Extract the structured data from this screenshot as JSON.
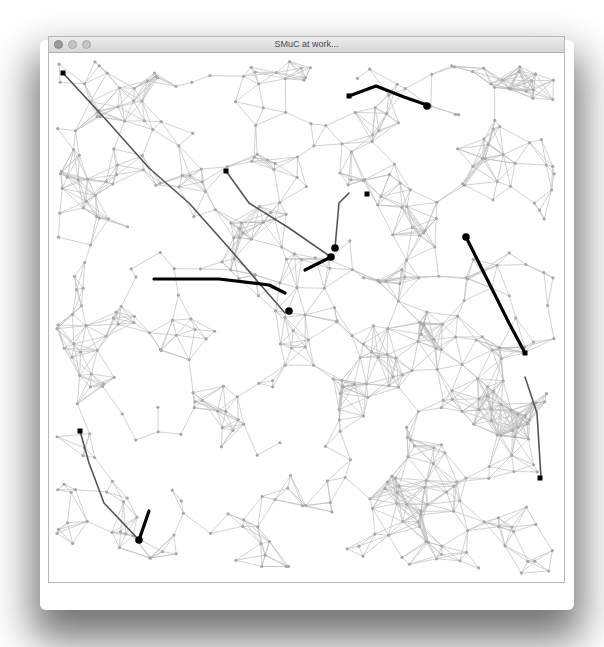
{
  "window": {
    "title": "SMuC at work...",
    "traffic_lights": [
      "close",
      "minimize",
      "zoom"
    ],
    "focused": false
  },
  "graph": {
    "node_color": "#a8a8a8",
    "edge_color": "#b4b4b4",
    "path_color": "#000000",
    "trail_color": "#555555",
    "background": "#ffffff",
    "node_count": 520,
    "seed": 7,
    "paths": [
      {
        "trail": [
          [
            14,
            20
          ],
          [
            60,
            70
          ],
          [
            100,
            115
          ],
          [
            140,
            150
          ],
          [
            180,
            195
          ],
          [
            210,
            230
          ],
          [
            236,
            260
          ]
        ],
        "bold": [
          [
            105,
            226
          ],
          [
            170,
            226
          ],
          [
            220,
            232
          ],
          [
            236,
            240
          ]
        ],
        "end": [
          240,
          258
        ],
        "start": [
          14,
          20
        ]
      },
      {
        "trail": [
          [
            177,
            118
          ],
          [
            200,
            150
          ],
          [
            240,
            175
          ],
          [
            282,
            204
          ]
        ],
        "bold": [
          [
            256,
            217
          ],
          [
            282,
            204
          ]
        ],
        "end": [
          282,
          204
        ],
        "start": [
          177,
          118
        ]
      },
      {
        "trail": [
          [
            300,
            140
          ],
          [
            290,
            150
          ],
          [
            286,
            195
          ]
        ],
        "bold": [],
        "end": [
          286,
          195
        ],
        "start": [
          318,
          141
        ]
      },
      {
        "bold": [
          [
            300,
            43
          ],
          [
            327,
            33
          ],
          [
            355,
            44
          ],
          [
            378,
            52
          ]
        ],
        "end": [
          378,
          53
        ],
        "start": [
          300,
          43
        ]
      },
      {
        "trail": [
          [
            476,
            324
          ],
          [
            488,
            360
          ],
          [
            492,
            425
          ]
        ],
        "bold": [
          [
            417,
            184
          ],
          [
            445,
            240
          ],
          [
            460,
            270
          ],
          [
            476,
            300
          ]
        ],
        "end": [
          417,
          184
        ],
        "start": [
          476,
          300
        ],
        "endsq": [
          491,
          425
        ]
      },
      {
        "trail": [
          [
            31,
            378
          ],
          [
            40,
            410
          ],
          [
            55,
            450
          ],
          [
            90,
            487
          ]
        ],
        "bold": [
          [
            90,
            487
          ],
          [
            100,
            458
          ]
        ],
        "end": [
          90,
          487
        ],
        "start": [
          31,
          378
        ]
      }
    ]
  }
}
